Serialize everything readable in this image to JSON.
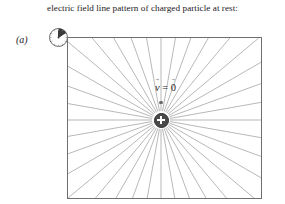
{
  "caption": {
    "text": "electric field line pattern of charged particle at rest:"
  },
  "panel": {
    "label": "(a)"
  },
  "diagram": {
    "name": "radial-electric-field-diagram",
    "velocity_label": {
      "symbol": "v",
      "equals": "=",
      "value": "0"
    },
    "charge": {
      "sign": "+",
      "polarity": "positive"
    },
    "colors": {
      "field_line": "#9a9a9a",
      "frame_border": "#6f6f6f",
      "charge_fill": "#4a4a4a",
      "charge_symbol": "#ffffff",
      "text": "#24201e",
      "background": "#ffffff",
      "clock_wedge": "#3c3c3c"
    },
    "field_lines_count": "36",
    "frame": {
      "width": "195",
      "height": "162"
    },
    "charge_position": {
      "x": "93",
      "y": "82"
    }
  },
  "clock": {
    "name": "clock-icon",
    "wedge_from_oclock": "12",
    "wedge_to_oclock": "1:30",
    "hand_direction": "up-right"
  }
}
